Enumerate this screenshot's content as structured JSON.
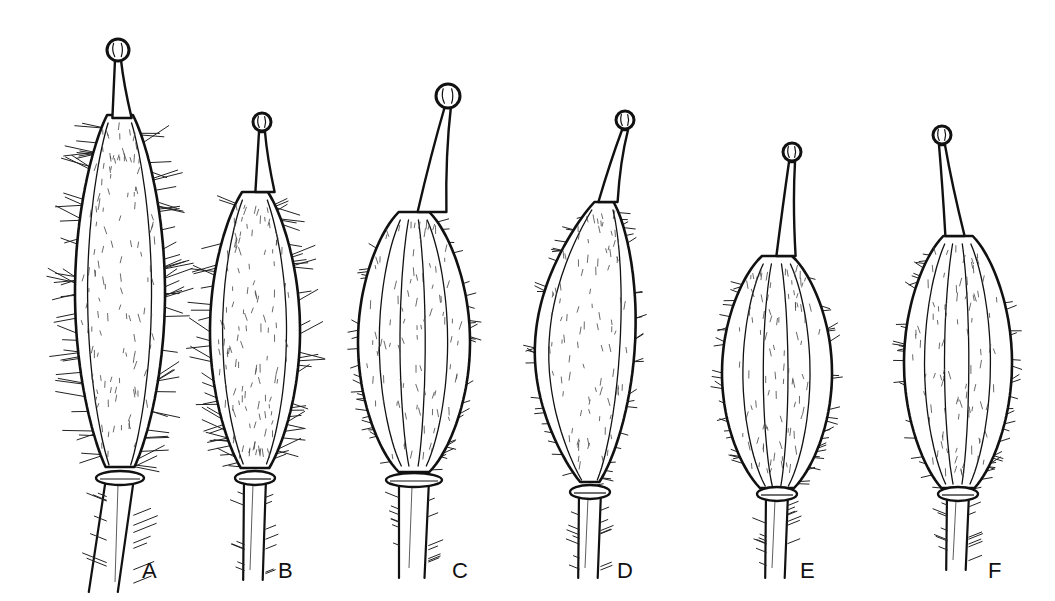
{
  "figure": {
    "type": "botanical line illustration",
    "background": "#ffffff",
    "ink_color": "#111111",
    "specimens": [
      {
        "label": "A",
        "stigma": [
          118,
          50
        ],
        "style_base": [
          122,
          118
        ],
        "body": {
          "cx": 120,
          "top": 115,
          "bottom": 470,
          "halfwidth": 45,
          "shape": "long-narrow"
        },
        "collar_y": 478,
        "stalk_bottom": 592,
        "label_pos": [
          142,
          578
        ],
        "hairiness": "very dense long"
      },
      {
        "label": "B",
        "stigma": [
          262,
          122
        ],
        "style_base": [
          265,
          192
        ],
        "body": {
          "cx": 255,
          "top": 192,
          "bottom": 470,
          "halfwidth": 45,
          "shape": "long-narrow"
        },
        "collar_y": 478,
        "stalk_bottom": 580,
        "label_pos": [
          278,
          578
        ],
        "hairiness": "dense long"
      },
      {
        "label": "C",
        "stigma": [
          448,
          96
        ],
        "style_base": [
          432,
          212
        ],
        "body": {
          "cx": 414,
          "top": 212,
          "bottom": 472,
          "halfwidth": 56,
          "shape": "ribbed ovoid"
        },
        "collar_y": 480,
        "stalk_bottom": 578,
        "label_pos": [
          452,
          578
        ],
        "hairiness": "sparse short"
      },
      {
        "label": "D",
        "stigma": [
          625,
          120
        ],
        "style_base": [
          608,
          202
        ],
        "body": {
          "cx": 590,
          "top": 202,
          "bottom": 485,
          "halfwidth": 50,
          "shape": "asymmetric bulging"
        },
        "collar_y": 492,
        "stalk_bottom": 578,
        "label_pos": [
          617,
          578
        ],
        "hairiness": "sparse short"
      },
      {
        "label": "E",
        "stigma": [
          792,
          152
        ],
        "style_base": [
          786,
          256
        ],
        "body": {
          "cx": 777,
          "top": 256,
          "bottom": 490,
          "halfwidth": 55,
          "shape": "ribbed ellipsoid"
        },
        "collar_y": 494,
        "stalk_bottom": 578,
        "label_pos": [
          800,
          578
        ],
        "hairiness": "sparse short"
      },
      {
        "label": "F",
        "stigma": [
          942,
          135
        ],
        "style_base": [
          955,
          236
        ],
        "body": {
          "cx": 958,
          "top": 236,
          "bottom": 490,
          "halfwidth": 54,
          "shape": "ribbed ellipsoid"
        },
        "collar_y": 494,
        "stalk_bottom": 570,
        "label_pos": [
          988,
          578
        ],
        "hairiness": "sparse short"
      }
    ]
  }
}
